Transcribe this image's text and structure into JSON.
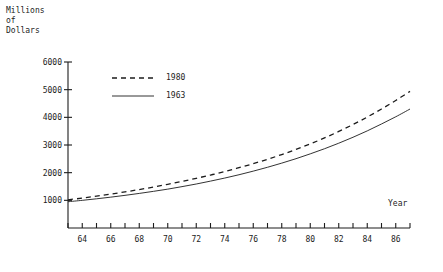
{
  "chart_data": {
    "type": "line",
    "title": "",
    "subtitle": "",
    "ylabel": "Millions\nof\nDollars",
    "xlabel": "Year",
    "grid": false,
    "legend_position": "top-left-inside",
    "xlim": [
      63,
      87
    ],
    "ylim": [
      0,
      6000
    ],
    "ytick_labels": [
      "6000",
      "5000",
      "4000",
      "3000",
      "2000",
      "1000"
    ],
    "ytick_values": [
      6000,
      5000,
      4000,
      3000,
      2000,
      1000
    ],
    "xtick_values": [
      63,
      64,
      65,
      66,
      67,
      68,
      69,
      70,
      71,
      72,
      73,
      74,
      75,
      76,
      77,
      78,
      79,
      80,
      81,
      82,
      83,
      84,
      85,
      86,
      87
    ],
    "xtick_labels": [
      "64",
      "66",
      "68",
      "70",
      "72",
      "74",
      "76",
      "78",
      "80",
      "82",
      "84",
      "86"
    ],
    "xtick_label_values": [
      64,
      66,
      68,
      70,
      72,
      74,
      76,
      78,
      80,
      82,
      84,
      86
    ],
    "x": [
      63,
      64,
      65,
      66,
      67,
      68,
      69,
      70,
      71,
      72,
      73,
      74,
      75,
      76,
      77,
      78,
      79,
      80,
      81,
      82,
      83,
      84,
      85,
      86,
      87
    ],
    "series": [
      {
        "name": "1980",
        "style": "dashed",
        "color": "#1c1c1c",
        "values": [
          1020,
          1080,
          1150,
          1225,
          1305,
          1390,
          1480,
          1580,
          1685,
          1795,
          1915,
          2040,
          2180,
          2325,
          2485,
          2655,
          2840,
          3040,
          3255,
          3490,
          3740,
          4010,
          4300,
          4610,
          4940
        ]
      },
      {
        "name": "1963",
        "style": "solid",
        "color": "#1c1c1c",
        "values": [
          950,
          1000,
          1055,
          1115,
          1180,
          1250,
          1325,
          1405,
          1495,
          1590,
          1695,
          1805,
          1925,
          2055,
          2195,
          2345,
          2505,
          2680,
          2865,
          3065,
          3280,
          3510,
          3760,
          4020,
          4300
        ]
      }
    ]
  },
  "legend": {
    "entries": [
      {
        "label": "1980",
        "style": "dashed"
      },
      {
        "label": "1963",
        "style": "solid"
      }
    ]
  },
  "caption": {
    "text": ""
  }
}
